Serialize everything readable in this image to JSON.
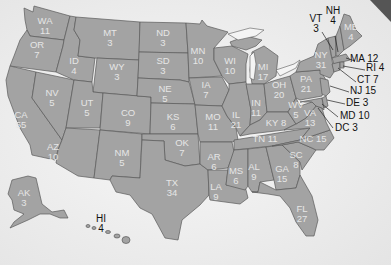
{
  "map": {
    "title": "Electoral votes by state",
    "colors": {
      "land": "#a3a3a3",
      "border": "#5a5a5a",
      "label": "#e6e6e6",
      "callout": "#111111",
      "background": "#f2f2f2"
    },
    "states": [
      {
        "abbr": "WA",
        "votes": "11"
      },
      {
        "abbr": "OR",
        "votes": "7"
      },
      {
        "abbr": "CA",
        "votes": "55"
      },
      {
        "abbr": "ID",
        "votes": "4"
      },
      {
        "abbr": "NV",
        "votes": "5"
      },
      {
        "abbr": "MT",
        "votes": "3"
      },
      {
        "abbr": "WY",
        "votes": "3"
      },
      {
        "abbr": "UT",
        "votes": "5"
      },
      {
        "abbr": "AZ",
        "votes": "10"
      },
      {
        "abbr": "CO",
        "votes": "9"
      },
      {
        "abbr": "NM",
        "votes": "5"
      },
      {
        "abbr": "ND",
        "votes": "3"
      },
      {
        "abbr": "SD",
        "votes": "3"
      },
      {
        "abbr": "NE",
        "votes": "5"
      },
      {
        "abbr": "KS",
        "votes": "6"
      },
      {
        "abbr": "OK",
        "votes": "7"
      },
      {
        "abbr": "TX",
        "votes": "34"
      },
      {
        "abbr": "MN",
        "votes": "10"
      },
      {
        "abbr": "IA",
        "votes": "7"
      },
      {
        "abbr": "MO",
        "votes": "11"
      },
      {
        "abbr": "AR",
        "votes": "6"
      },
      {
        "abbr": "LA",
        "votes": "9"
      },
      {
        "abbr": "WI",
        "votes": "10"
      },
      {
        "abbr": "IL",
        "votes": "21"
      },
      {
        "abbr": "MI",
        "votes": "17"
      },
      {
        "abbr": "IN",
        "votes": "11"
      },
      {
        "abbr": "OH",
        "votes": "20"
      },
      {
        "abbr": "KY",
        "votes": "8"
      },
      {
        "abbr": "TN",
        "votes": "11"
      },
      {
        "abbr": "MS",
        "votes": "6"
      },
      {
        "abbr": "AL",
        "votes": "9"
      },
      {
        "abbr": "GA",
        "votes": "15"
      },
      {
        "abbr": "FL",
        "votes": "27"
      },
      {
        "abbr": "SC",
        "votes": "8"
      },
      {
        "abbr": "NC",
        "votes": "15"
      },
      {
        "abbr": "VA",
        "votes": "13"
      },
      {
        "abbr": "WV",
        "votes": "5"
      },
      {
        "abbr": "PA",
        "votes": "21"
      },
      {
        "abbr": "NY",
        "votes": "31"
      },
      {
        "abbr": "ME",
        "votes": "4"
      },
      {
        "abbr": "AK",
        "votes": "3"
      }
    ],
    "callouts": [
      {
        "abbr": "VT",
        "votes": "3"
      },
      {
        "abbr": "NH",
        "votes": "4"
      },
      {
        "abbr": "MA",
        "votes": "12"
      },
      {
        "abbr": "RI",
        "votes": "4"
      },
      {
        "abbr": "CT",
        "votes": "7"
      },
      {
        "abbr": "NJ",
        "votes": "15"
      },
      {
        "abbr": "DE",
        "votes": "3"
      },
      {
        "abbr": "MD",
        "votes": "10"
      },
      {
        "abbr": "DC",
        "votes": "3"
      },
      {
        "abbr": "HI",
        "votes": "4"
      }
    ]
  }
}
